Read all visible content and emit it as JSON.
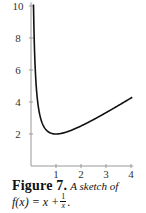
{
  "chart_data": {
    "type": "line",
    "title": "",
    "xlabel": "",
    "ylabel": "",
    "x_ticks": [
      1,
      2,
      3,
      4
    ],
    "y_ticks": [
      2,
      4,
      6,
      8,
      10
    ],
    "xlim": [
      0,
      4.05
    ],
    "ylim": [
      0,
      10.2
    ],
    "grid": false,
    "legend": null,
    "series": [
      {
        "name": "f(x) = x + 1/x",
        "function": "x + 1/x",
        "x": [
          0.1,
          0.15,
          0.2,
          0.3,
          0.4,
          0.5,
          0.6,
          0.7,
          0.8,
          0.9,
          1.0,
          1.25,
          1.5,
          2.0,
          2.5,
          3.0,
          3.5,
          4.0,
          4.05
        ],
        "values": [
          10.1,
          6.82,
          5.2,
          3.63,
          2.9,
          2.5,
          2.27,
          2.13,
          2.05,
          2.01,
          2.0,
          2.05,
          2.17,
          2.5,
          2.9,
          3.33,
          3.79,
          4.25,
          4.3
        ]
      }
    ],
    "annotations": []
  },
  "axes": {
    "x_tick_labels": [
      "1",
      "2",
      "3",
      "4"
    ],
    "y_tick_labels": [
      "2",
      "4",
      "6",
      "8",
      "10"
    ]
  },
  "caption": {
    "label": "Figure 7.",
    "description": "A sketch of",
    "formula_lhs": "f(x) = x +",
    "formula_num": "1",
    "formula_den": "x",
    "formula_end": "."
  }
}
